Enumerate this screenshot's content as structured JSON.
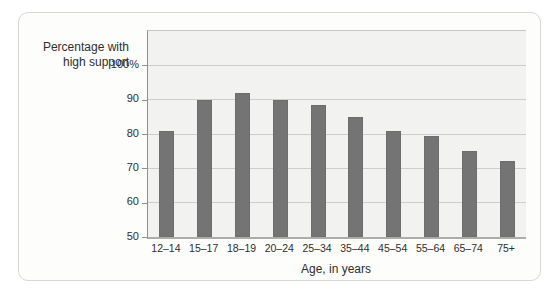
{
  "figure": {
    "y_axis_title": {
      "line1": "Percentage with",
      "line2": "high support"
    },
    "x_axis_title": "Age, in years"
  },
  "chart_data": {
    "type": "bar",
    "title": "",
    "xlabel": "Age, in years",
    "ylabel": "Percentage with high support",
    "categories": [
      "12–14",
      "15–17",
      "18–19",
      "20–24",
      "25–34",
      "35–44",
      "45–54",
      "55–64",
      "65–74",
      "75+"
    ],
    "values": [
      81,
      90,
      92,
      90,
      88.5,
      85,
      81,
      79.5,
      75,
      72
    ],
    "ylim": [
      50,
      110
    ],
    "yticks": [
      {
        "value": 100,
        "label": "100%"
      },
      {
        "value": 90,
        "label": "90"
      },
      {
        "value": 80,
        "label": "80"
      },
      {
        "value": 70,
        "label": "70"
      },
      {
        "value": 60,
        "label": "60"
      },
      {
        "value": 50,
        "label": "50"
      }
    ],
    "gridline_values": [
      100,
      90,
      80,
      70,
      60
    ],
    "grid": "horizontal-major",
    "legend": "none",
    "colors": {
      "bar": "#747474",
      "plot_background": "#f2f2f0",
      "gridline": "#cdcdcb",
      "axis": "#90908e",
      "baseline": "#acacaa",
      "text": "#2e2e2e",
      "card_border": "#d7d7d5",
      "card_background": "#fdfdfc"
    }
  }
}
